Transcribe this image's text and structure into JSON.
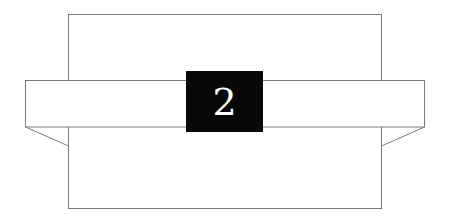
{
  "figure": {
    "canvas": {
      "width": 449,
      "height": 224,
      "background_color": "#ffffff"
    },
    "stroke": {
      "color": "#7a7a7a",
      "width": 1
    },
    "shapes": {
      "vertical_panel": {
        "name": "tall-rectangle",
        "fill": "#ffffff",
        "x": 68,
        "y": 14,
        "width": 314,
        "height": 195
      },
      "horizontal_band": {
        "name": "wide-band",
        "fill": "#ffffff",
        "x": 25,
        "y": 80,
        "width": 400,
        "height": 47
      },
      "left_flap": {
        "name": "left-diagonal-flap",
        "from_x": 25,
        "from_y": 127,
        "to_x": 68,
        "to_y": 146
      },
      "right_flap": {
        "name": "right-diagonal-flap",
        "from_x": 425,
        "from_y": 127,
        "to_x": 382,
        "to_y": 146
      },
      "label_block": {
        "name": "black-label-square",
        "fill": "#080808",
        "x": 186,
        "y": 71,
        "width": 77,
        "height": 61,
        "text": "2",
        "text_color": "#ffffff"
      }
    }
  }
}
